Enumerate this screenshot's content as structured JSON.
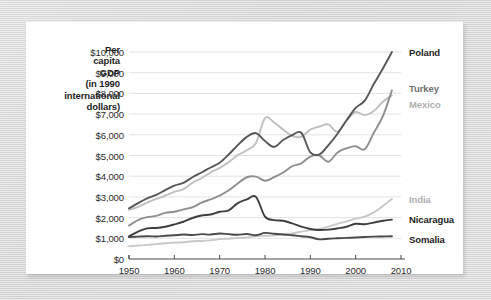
{
  "chart_data": {
    "type": "line",
    "title": "",
    "ylabel": "Per capita GDP (in 1990 international dollars)",
    "ylabel_lines": [
      "Per",
      "capita",
      "GDP",
      "(in 1990",
      "international",
      "dollars)"
    ],
    "xlabel": "",
    "xlim": [
      1950,
      2010
    ],
    "ylim": [
      0,
      10000
    ],
    "grid": true,
    "legend_position": "right-inline",
    "xticks": [
      "1950",
      "1960",
      "1970",
      "1980",
      "1990",
      "2000",
      "2010"
    ],
    "xtick_values": [
      1950,
      1960,
      1970,
      1980,
      1990,
      2000,
      2010
    ],
    "yticks": [
      "$0",
      "$1,000",
      "$2,000",
      "$3,000",
      "$4,000",
      "$5,000",
      "$6,000",
      "$7,000",
      "$8,000",
      "$9,000",
      "$10,000"
    ],
    "ytick_values": [
      0,
      1000,
      2000,
      3000,
      4000,
      5000,
      6000,
      7000,
      8000,
      9000,
      10000
    ],
    "x": [
      1950,
      1952,
      1954,
      1956,
      1958,
      1960,
      1962,
      1964,
      1966,
      1968,
      1970,
      1972,
      1974,
      1976,
      1978,
      1980,
      1982,
      1984,
      1986,
      1988,
      1990,
      1992,
      1994,
      1996,
      1998,
      2000,
      2002,
      2004,
      2006,
      2008
    ],
    "series": [
      {
        "name": "Poland",
        "color": "#565656",
        "label_color": "#1d1d1d",
        "label_value": 10000,
        "values": [
          2447,
          2700,
          2930,
          3100,
          3330,
          3550,
          3680,
          3950,
          4180,
          4420,
          4650,
          5050,
          5500,
          5900,
          6080,
          5700,
          5420,
          5750,
          5980,
          6100,
          5150,
          5050,
          5500,
          6050,
          6700,
          7300,
          7650,
          8450,
          9200,
          10000
        ]
      },
      {
        "name": "Turkey",
        "color": "#8f8f8f",
        "label_color": "#6f6f6f",
        "label_value": 8150,
        "values": [
          1620,
          1880,
          2020,
          2080,
          2230,
          2280,
          2400,
          2500,
          2720,
          2880,
          3060,
          3320,
          3650,
          3950,
          3980,
          3780,
          3950,
          4180,
          4480,
          4620,
          4950,
          5000,
          4700,
          5150,
          5350,
          5450,
          5300,
          6100,
          6900,
          8150
        ]
      },
      {
        "name": "Mexico",
        "color": "#c0c0c0",
        "label_color": "#b0b0b0",
        "label_value": 7900,
        "values": [
          2365,
          2520,
          2720,
          2900,
          3060,
          3240,
          3380,
          3680,
          3900,
          4180,
          4400,
          4680,
          5020,
          5250,
          5600,
          6800,
          6600,
          6250,
          5950,
          5900,
          6250,
          6400,
          6500,
          6150,
          6700,
          7100,
          6950,
          7150,
          7600,
          7900
        ]
      },
      {
        "name": "India",
        "color": "#c8c8c8",
        "label_color": "#b0b0b0",
        "label_value": 2900,
        "values": [
          619,
          650,
          680,
          720,
          760,
          790,
          810,
          860,
          870,
          900,
          960,
          980,
          1020,
          1040,
          1100,
          1120,
          1140,
          1200,
          1240,
          1320,
          1400,
          1450,
          1560,
          1700,
          1820,
          1950,
          2050,
          2250,
          2560,
          2900
        ]
      },
      {
        "name": "Nicaragua",
        "color": "#3f3f3f",
        "label_color": "#1d1d1d",
        "label_value": 1900,
        "values": [
          1100,
          1320,
          1480,
          1500,
          1560,
          1670,
          1800,
          1980,
          2100,
          2150,
          2280,
          2350,
          2700,
          2880,
          3000,
          2050,
          1880,
          1850,
          1720,
          1560,
          1450,
          1400,
          1420,
          1480,
          1560,
          1700,
          1680,
          1760,
          1850,
          1900
        ]
      },
      {
        "name": "Somalia",
        "color": "#4a4a4a",
        "label_color": "#1d1d1d",
        "label_value": 1100,
        "values": [
          1057,
          1080,
          1100,
          1090,
          1120,
          1150,
          1180,
          1160,
          1200,
          1180,
          1230,
          1200,
          1170,
          1210,
          1150,
          1260,
          1220,
          1180,
          1150,
          1100,
          1050,
          950,
          980,
          1000,
          1020,
          1040,
          1060,
          1080,
          1090,
          1100
        ]
      }
    ]
  }
}
